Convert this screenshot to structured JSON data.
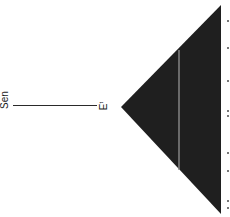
{
  "diagram": {
    "type": "collapsed-clade-tree",
    "orientation": "rotated-90-ccw",
    "root_label": "Sen",
    "clade_label": {
      "main": "E",
      "superscript": "t"
    },
    "colors": {
      "clade_fill": "#1f1f1f",
      "inner_line": "#8a8a8a",
      "branch": "#2a2a2a",
      "background": "#ffffff",
      "tick": "#777777"
    },
    "clade_triangle": {
      "apex": [
        121,
        107
      ],
      "top": [
        221,
        5
      ],
      "bottom": [
        221,
        214
      ]
    },
    "inner_line": {
      "x": 179,
      "y_start": 50,
      "y_end": 170
    },
    "edge_ticks_y": [
      20,
      47,
      80,
      110,
      115,
      152,
      170,
      200,
      207
    ]
  }
}
